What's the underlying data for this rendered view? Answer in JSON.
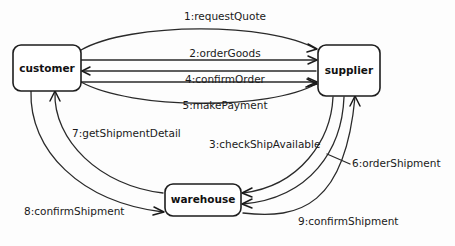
{
  "diagram": {
    "type": "uml-communication-diagram",
    "title": "",
    "stroke_color": "#2a2a2a",
    "box_fill": "#ffffff",
    "nodes": [
      {
        "id": "customer",
        "label": "customer",
        "x": 13,
        "y": 45,
        "w": 68,
        "h": 46
      },
      {
        "id": "supplier",
        "label": "supplier",
        "x": 318,
        "y": 45,
        "w": 62,
        "h": 51
      },
      {
        "id": "warehouse",
        "label": "warehouse",
        "x": 165,
        "y": 184,
        "w": 76,
        "h": 32
      }
    ],
    "messages": [
      {
        "seq": "1",
        "name": "requestQuote",
        "label": "1:requestQuote",
        "from": "customer",
        "to": "supplier",
        "lx": 225,
        "ly": 17,
        "align": "middle"
      },
      {
        "seq": "2",
        "name": "orderGoods",
        "label": "2:orderGoods",
        "from": "customer",
        "to": "supplier",
        "lx": 225,
        "ly": 54,
        "align": "middle"
      },
      {
        "seq": "3",
        "name": "checkShipAvailable",
        "label": "3:checkShipAvailable",
        "from": "supplier",
        "to": "warehouse",
        "lx": 209,
        "ly": 145,
        "align": "start"
      },
      {
        "seq": "4",
        "name": "confirmOrder",
        "label": "4:confirmOrder",
        "from": "supplier",
        "to": "customer",
        "lx": 225,
        "ly": 80,
        "align": "middle"
      },
      {
        "seq": "5",
        "name": "makePayment",
        "label": "5:makePayment",
        "from": "customer",
        "to": "supplier",
        "lx": 225,
        "ly": 106,
        "align": "middle"
      },
      {
        "seq": "6",
        "name": "orderShipment",
        "label": "6:orderShipment",
        "from": "supplier",
        "to": "warehouse",
        "lx": 352,
        "ly": 164,
        "align": "start"
      },
      {
        "seq": "7",
        "name": "getShipmentDetail",
        "label": "7:getShipmentDetail",
        "from": "warehouse",
        "to": "customer",
        "lx": 72,
        "ly": 134,
        "align": "start"
      },
      {
        "seq": "8",
        "name": "confirmShipment",
        "label": "8:confirmShipment",
        "from": "customer",
        "to": "warehouse",
        "lx": 24,
        "ly": 212,
        "align": "start"
      },
      {
        "seq": "9",
        "name": "confirmShipment",
        "label": "9:confirmShipment",
        "from": "warehouse",
        "to": "supplier",
        "lx": 298,
        "ly": 222,
        "align": "start"
      }
    ]
  }
}
